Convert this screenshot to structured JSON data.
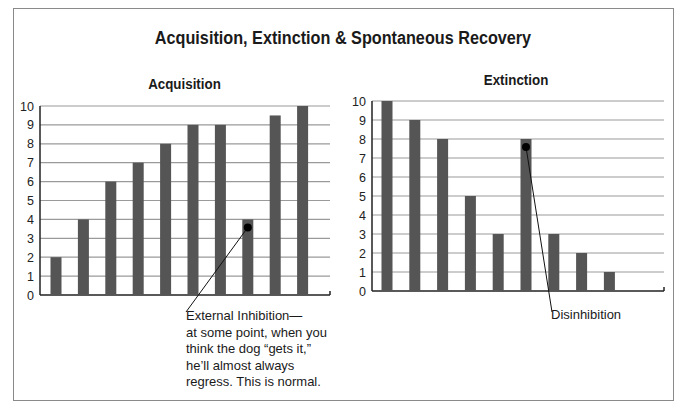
{
  "title": "Acquisition, Extinction & Spontaneous Recovery",
  "colors": {
    "bar": "#555555",
    "grid": "#9a9a9a",
    "axis": "#222222",
    "border": "#8a8a8a"
  },
  "chart_data": [
    {
      "type": "bar",
      "title": "Acquisition",
      "categories": [
        "1",
        "2",
        "3",
        "4",
        "5",
        "6",
        "7",
        "8",
        "9",
        "10"
      ],
      "values": [
        2,
        4,
        6,
        7,
        8,
        9,
        9,
        4,
        9.5,
        10
      ],
      "xlabel": "",
      "ylabel": "",
      "ylim": [
        0,
        10
      ],
      "yticks": [
        0,
        1,
        2,
        3,
        4,
        5,
        6,
        7,
        8,
        9,
        10
      ],
      "grid": true,
      "annotation": {
        "target_index": 7,
        "text": "External Inhibition—\nat some point, when you\nthink the dog “gets it,”\nhe’ll almost always\nregress. This is normal."
      }
    },
    {
      "type": "bar",
      "title": "Extinction",
      "categories": [
        "1",
        "2",
        "3",
        "4",
        "5",
        "6",
        "7",
        "8",
        "9"
      ],
      "values": [
        10,
        9,
        8,
        5,
        3,
        8,
        3,
        2,
        1
      ],
      "xlabel": "",
      "ylabel": "",
      "ylim": [
        0,
        10
      ],
      "yticks": [
        0,
        1,
        2,
        3,
        4,
        5,
        6,
        7,
        8,
        9,
        10
      ],
      "grid": true,
      "annotation": {
        "target_index": 5,
        "text": "Disinhibition"
      }
    }
  ]
}
